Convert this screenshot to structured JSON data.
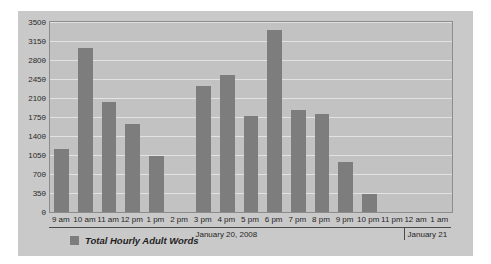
{
  "chart_data": {
    "type": "bar",
    "title": "",
    "xlabel": "",
    "ylabel": "",
    "ylim": [
      0,
      3500
    ],
    "yticks": [
      0,
      350,
      700,
      1050,
      1400,
      1750,
      2100,
      2450,
      2800,
      3150,
      3500
    ],
    "grid": true,
    "legend_position": "bottom-left",
    "categories": [
      "9 am",
      "10 am",
      "11 am",
      "12 pm",
      "1 pm",
      "2 pm",
      "3 pm",
      "4 pm",
      "5 pm",
      "6 pm",
      "7 pm",
      "8 pm",
      "9 pm",
      "10 pm",
      "11 pm",
      "12 am",
      "1 am"
    ],
    "series": [
      {
        "name": "Total Hourly Adult Words",
        "color": "#7d7d7d",
        "values": [
          1170,
          3020,
          2030,
          1625,
          1040,
          0,
          2330,
          2520,
          1770,
          3350,
          1880,
          1810,
          930,
          330,
          0,
          0,
          0
        ]
      }
    ],
    "date_bands": [
      {
        "label": "January 20, 2008",
        "start_category": "9 am",
        "end_category": "11 pm"
      },
      {
        "label": "January 21",
        "start_category": "12 am",
        "end_category": "1 am"
      }
    ]
  },
  "legend": {
    "label": "Total Hourly Adult Words",
    "swatch_color": "#7d7d7d"
  },
  "colors": {
    "card_background": "#c9c9c9",
    "plot_background": "#c2c2c2",
    "bar": "#7d7d7d",
    "gridline": "#e2e2e2",
    "axis": "#8d8d8d",
    "text": "#1f1f1f"
  }
}
